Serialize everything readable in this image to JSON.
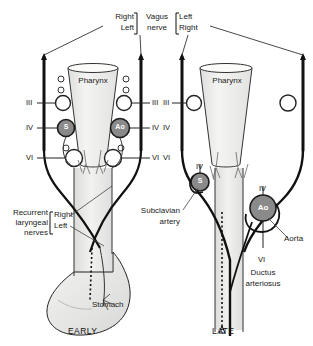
{
  "figure": {
    "panels": [
      {
        "id": "early",
        "caption": "EARLY"
      },
      {
        "id": "late",
        "caption": "LATE"
      }
    ]
  },
  "colors": {
    "ink": "#111111",
    "vessel_gray": "#8a8a8a",
    "tissue_gray": "#e8e8e6",
    "pharynx_gray": "#ededea",
    "background": "#ffffff"
  },
  "top_labels": {
    "left_bracket": {
      "line1": "Right",
      "line2": "Left"
    },
    "center": {
      "line1": "Vagus",
      "line2": "nerve"
    },
    "right_bracket": {
      "line1": "Left",
      "line2": "Right"
    }
  },
  "early_panel": {
    "caption": "EARLY",
    "organ_label": "Pharynx",
    "stomach_label": "Stomach",
    "arch_labels_left": [
      "III",
      "IV",
      "VI"
    ],
    "arch_labels_right": [
      "III",
      "IV",
      "VI"
    ],
    "vessel_marks": [
      {
        "id": "subclavian",
        "text": "S"
      },
      {
        "id": "aorta",
        "text": "Ao"
      }
    ],
    "nerve_label": {
      "line1": "Recurrent",
      "line2": "laryngeal",
      "line3": "nerves",
      "bracket": {
        "line1": "Right",
        "line2": "Left"
      }
    }
  },
  "late_panel": {
    "caption": "LATE",
    "organ_label": "Pharynx",
    "arch_labels_left": [
      "III",
      "IV",
      "VI"
    ],
    "subclavian_mark": "S",
    "subclavian_arch": "IV",
    "subclavian_label": {
      "line1": "Subclavian",
      "line2": "artery"
    },
    "aorta_mark": "Ao",
    "aorta_arch": "IV",
    "aorta_label": "Aorta",
    "ductus_arch": "VI",
    "ductus_label": {
      "line1": "Ductus",
      "line2": "arteriosus"
    }
  }
}
